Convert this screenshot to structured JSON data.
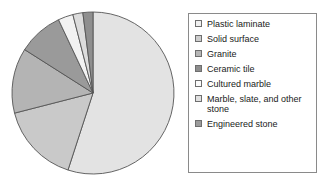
{
  "chart_data": {
    "type": "pie",
    "title": "",
    "subtitle": "",
    "xlabel": "",
    "ylabel": "",
    "grid": false,
    "legend_position": "right",
    "start_angle_deg": 90,
    "direction": "clockwise",
    "categories": [
      "Plastic laminate",
      "Solid surface",
      "Granite",
      "Ceramic tile",
      "Cultured marble",
      "Marble, slate, and other stone",
      "Engineered stone"
    ],
    "values": [
      55,
      16,
      13,
      9,
      3,
      2,
      2
    ],
    "colors": [
      "#e3e3e3",
      "#c9c9c9",
      "#b4b4b4",
      "#9a9a9a",
      "#f2f2f2",
      "#dcdcdc",
      "#8f8f8f"
    ],
    "slice_border_color": "#555555",
    "background_color": "#ffffff"
  },
  "legend": {
    "border_color": "#8a8a8a",
    "items": [
      {
        "label": "Plastic laminate",
        "swatch": "#f0f0f0"
      },
      {
        "label": "Solid surface",
        "swatch": "#cdcdcd"
      },
      {
        "label": "Granite",
        "swatch": "#b6b6b6"
      },
      {
        "label": "Ceramic tile",
        "swatch": "#8d8d8d"
      },
      {
        "label": "Cultured marble",
        "swatch": "#fbfbfb"
      },
      {
        "label": "Marble, slate, and other stone",
        "swatch": "#e0e0e0"
      },
      {
        "label": "Engineered stone",
        "swatch": "#9b9b9b"
      }
    ]
  }
}
